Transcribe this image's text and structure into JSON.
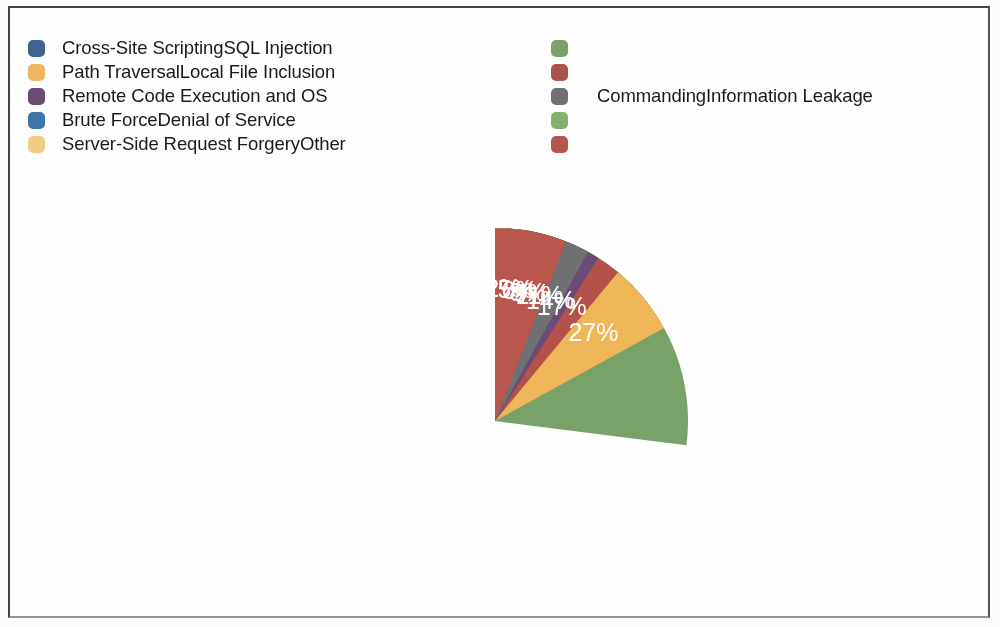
{
  "figure": {
    "background_color": "#ffffff",
    "frame_color": "#3c4450"
  },
  "legend": {
    "left_column": [
      {
        "label": "Cross-Site ScriptingSQL Injection",
        "color": "#3d6496"
      },
      {
        "label": "Path TraversalLocal File Inclusion",
        "color": "#f0b759"
      },
      {
        "label": "Remote Code Execution and OS",
        "color": "#6c4b77"
      },
      {
        "label": "Brute ForceDenial of Service",
        "color": "#3a76ab"
      },
      {
        "label": "Server-Side Request ForgeryOther",
        "color": "#f5cd7f"
      }
    ],
    "right_column": [
      {
        "label": "",
        "color": "#79a268"
      },
      {
        "label": "",
        "color": "#b4524a"
      },
      {
        "label": "CommandingInformation Leakage",
        "color": "#6f7173"
      },
      {
        "label": "",
        "color": "#86b16d"
      },
      {
        "label": "",
        "color": "#bb574c"
      }
    ]
  },
  "chart_data": {
    "type": "pie",
    "title": "",
    "legend_position": "top",
    "start_angle_deg": 0,
    "direction": "clockwise",
    "labels_format": "percent",
    "categories": [
      "Cross-Site Scripting",
      "SQL Injection",
      "Path Traversal",
      "Local File Inclusion",
      "Remote Code Execution and OS Commanding",
      "Information Leakage",
      "Brute Force",
      "Denial of Service",
      "Server-Side Request Forgery",
      "Other"
    ],
    "values": [
      14,
      27,
      17,
      11,
      9,
      8,
      5,
      2,
      1,
      6
    ],
    "value_labels": [
      "14%",
      "27%",
      "17%",
      "11%",
      "9%",
      "8%",
      "5%",
      "2%",
      "1%",
      "6%"
    ],
    "colors": [
      "#3d6496",
      "#79a268",
      "#f0b759",
      "#b4524a",
      "#6c4b77",
      "#6f7173",
      "#3a76ab",
      "#86b16d",
      "#f5cd7f",
      "#bb574c"
    ],
    "label_colors": [
      "#ffffff",
      "#ffffff",
      "#ffffff",
      "#ffffff",
      "#ffffff",
      "#ffffff",
      "#ffffff",
      "#ffffff",
      "#1a1a1a",
      "#ffffff"
    ],
    "label_outside": [
      false,
      false,
      false,
      false,
      false,
      false,
      false,
      false,
      true,
      false
    ],
    "total": 100
  }
}
